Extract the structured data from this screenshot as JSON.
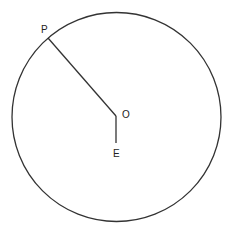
{
  "diagram": {
    "type": "circle-geometry",
    "circle": {
      "cx": 116.5,
      "cy": 117,
      "r": 104.5,
      "stroke": "#333333"
    },
    "points": {
      "P": {
        "label": "P",
        "x": 48,
        "y": 38
      },
      "O": {
        "label": "O",
        "x": 116,
        "y": 116
      },
      "E": {
        "label": "E",
        "x": 116,
        "y": 143
      }
    },
    "segments": [
      {
        "from": "P",
        "to": "O"
      },
      {
        "from": "O",
        "to": "E"
      }
    ]
  }
}
